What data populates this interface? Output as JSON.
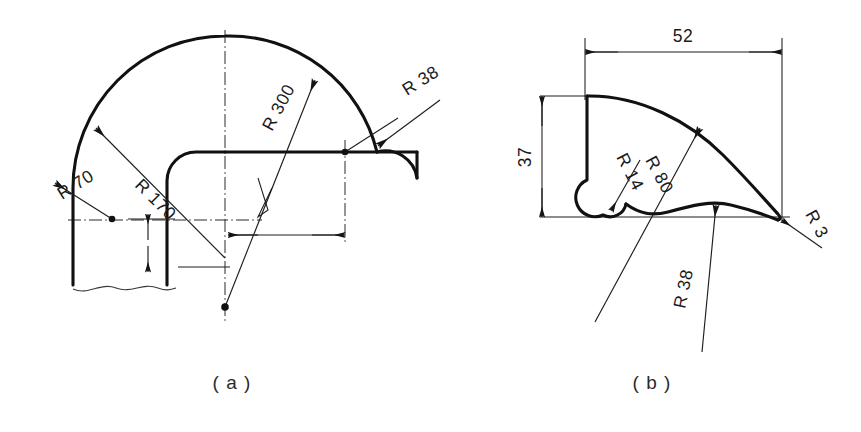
{
  "figure": {
    "kind": "engineering-drawing",
    "background_color": "#ffffff",
    "line_color": "#111111",
    "thin_line_color": "#1d1d1d",
    "sub_figures": [
      {
        "id": "a",
        "caption": "( a )",
        "dimensions": [
          {
            "name": "radius-70",
            "label": "R 70"
          },
          {
            "name": "radius-170",
            "label": "R 170"
          },
          {
            "name": "radius-300",
            "label": "R 300"
          },
          {
            "name": "radius-38",
            "label": "R 38"
          }
        ]
      },
      {
        "id": "b",
        "caption": "( b )",
        "dimensions": [
          {
            "name": "width-52",
            "label": "52"
          },
          {
            "name": "height-37",
            "label": "37"
          },
          {
            "name": "radius-14",
            "label": "R 14"
          },
          {
            "name": "radius-80",
            "label": "R 80"
          },
          {
            "name": "radius-38",
            "label": "R 38"
          },
          {
            "name": "radius-3",
            "label": "R 3"
          }
        ]
      }
    ]
  },
  "labels": {
    "a": {
      "r70": "R 70",
      "r170": "R 170",
      "r300": "R 300",
      "r38": "R 38",
      "caption": "( a )"
    },
    "b": {
      "d52": "52",
      "d37": "37",
      "r14": "R 14",
      "r80": "R 80",
      "r38": "R 38",
      "r3": "R 3",
      "caption": "( b )"
    }
  }
}
